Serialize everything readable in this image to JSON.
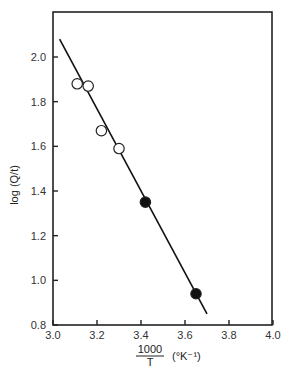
{
  "chart_data": {
    "type": "scatter",
    "title": "",
    "xlabel": "1000/T (°K⁻¹)",
    "xlabel_numerator": "1000",
    "xlabel_denominator": "T",
    "xlabel_unit": "(°K⁻¹)",
    "ylabel": "log (Q/t)",
    "xlim": [
      3.0,
      4.0
    ],
    "ylim": [
      0.8,
      2.1
    ],
    "xticks": [
      "3.0",
      "3.2",
      "3.4",
      "3.6",
      "3.8",
      "4.0"
    ],
    "yticks": [
      "0.8",
      "1.0",
      "1.2",
      "1.4",
      "1.6",
      "1.8",
      "2.0"
    ],
    "grid": false,
    "legend": null,
    "series": [
      {
        "name": "open circles",
        "marker": "open-circle",
        "x": [
          3.11,
          3.16,
          3.22,
          3.3
        ],
        "y": [
          1.88,
          1.87,
          1.67,
          1.59
        ]
      },
      {
        "name": "filled circles",
        "marker": "filled-circle",
        "x": [
          3.42,
          3.65
        ],
        "y": [
          1.35,
          0.94
        ]
      },
      {
        "name": "fit line",
        "type": "line",
        "x": [
          3.03,
          3.7
        ],
        "y": [
          2.08,
          0.85
        ]
      }
    ]
  }
}
